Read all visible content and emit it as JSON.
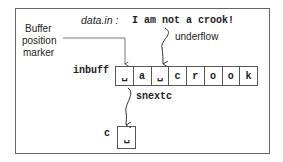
{
  "header": {
    "source_label": "data.in :",
    "source_text": "I am not a crook!"
  },
  "labels": {
    "buffer_marker": [
      "Buffer",
      "position",
      "marker"
    ],
    "underflow": "underflow",
    "inbuff": "inbuff",
    "snextc": "snextc",
    "c": "c"
  },
  "buffer_cells": [
    "␣",
    "a",
    "␣",
    "c",
    "r",
    "o",
    "o",
    "k"
  ],
  "c_value": "␣"
}
